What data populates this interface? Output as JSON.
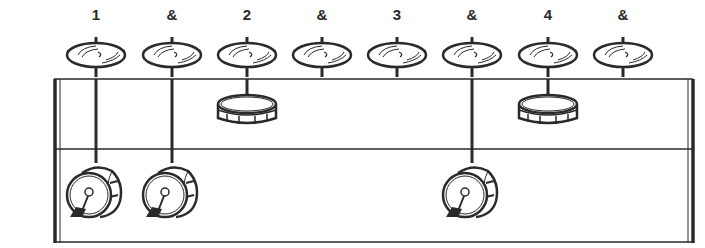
{
  "diagram": {
    "type": "drum-notation-pictogram",
    "counts": [
      "1",
      "&",
      "2",
      "&",
      "3",
      "&",
      "4",
      "&"
    ],
    "beat_x": [
      96,
      172,
      247,
      322,
      397,
      472,
      548,
      623
    ],
    "hihat": [
      true,
      true,
      true,
      true,
      true,
      true,
      true,
      true
    ],
    "snare": [
      false,
      false,
      true,
      false,
      false,
      false,
      true,
      false
    ],
    "kick": [
      true,
      true,
      false,
      false,
      false,
      true,
      false,
      false
    ],
    "colors": {
      "ink": "#2a2a2a",
      "background": "#ffffff"
    }
  }
}
